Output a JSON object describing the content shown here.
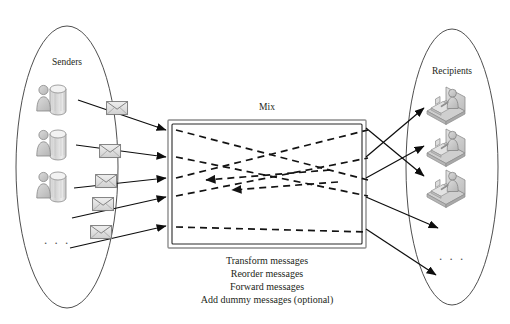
{
  "diagram": {
    "senders": {
      "label": "Senders",
      "ellipsis": ". . .",
      "icon_name": "user-database-icon",
      "count": 3
    },
    "recipients": {
      "label": "Recipients",
      "ellipsis": ". . .",
      "icon_name": "user-at-desk-icon",
      "count": 3
    },
    "mix": {
      "label": "Mix",
      "operations": [
        "Transform messages",
        "Reorder messages",
        "Forward messages",
        "Add dummy messages (optional)"
      ]
    },
    "messages": {
      "icon_name": "envelope-icon",
      "count": 5
    },
    "colors": {
      "background": "#ffffff",
      "text": "#231f20",
      "ellipse_stroke": "#3b3b3b",
      "arrow": "#0d0d0d",
      "box_outer_stroke": "#8d8d8d",
      "box_inner_stroke": "#2a2a2a",
      "icon_fill": "#c9c9c9",
      "icon_stroke": "#6e6e6e"
    }
  }
}
